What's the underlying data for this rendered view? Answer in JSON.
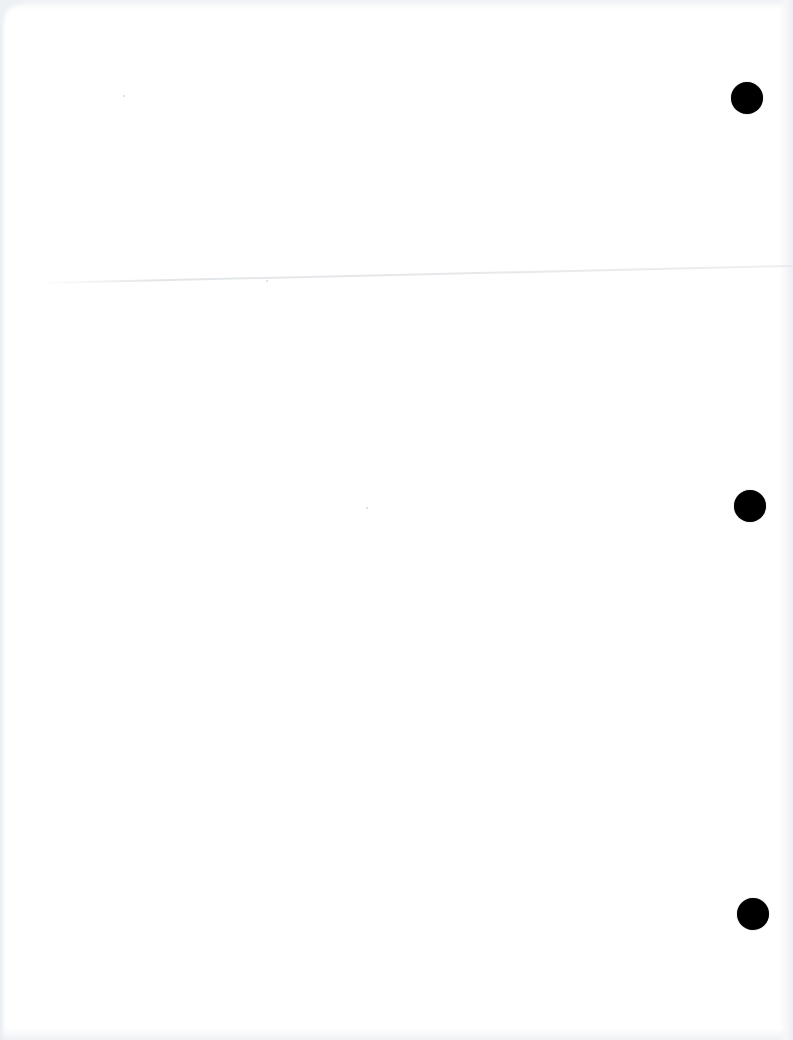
{
  "page": {
    "type": "blank-scanned-sheet",
    "background_color": "#ffffff",
    "text_content": "",
    "punch_holes": {
      "count": 3,
      "color": "#000000",
      "side": "right",
      "positions": [
        {
          "cx": 747,
          "cy": 98,
          "r": 16
        },
        {
          "cx": 750,
          "cy": 506,
          "r": 16
        },
        {
          "cx": 753,
          "cy": 914,
          "r": 16
        }
      ]
    },
    "fold_crease": {
      "visible": true,
      "approx_y_left": 290,
      "approx_y_right": 273
    }
  }
}
